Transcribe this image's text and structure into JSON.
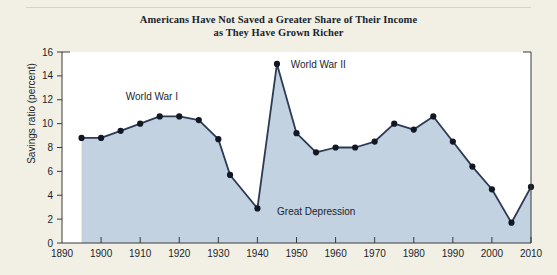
{
  "figure": {
    "background_color": "#f2efe4",
    "title_line1": "Americans Have Not Saved a Greater Share of Their Income",
    "title_line2": "as They Have Grown Richer"
  },
  "chart_data": {
    "type": "area",
    "title": "Americans Have Not Saved a Greater Share of Their Income as They Have Grown Richer",
    "xlabel": "",
    "ylabel": "Savings ratio (percent)",
    "xlim": [
      1890,
      2010
    ],
    "ylim": [
      0,
      16
    ],
    "xticks": [
      1890,
      1900,
      1910,
      1920,
      1930,
      1940,
      1950,
      1960,
      1970,
      1980,
      1990,
      2000,
      2010
    ],
    "yticks": [
      0,
      2,
      4,
      6,
      8,
      10,
      12,
      14,
      16
    ],
    "grid": false,
    "legend": "none",
    "line_color": "#2b3a55",
    "marker_color": "#111823",
    "fill_color": "#c3d2e0",
    "x": [
      1895,
      1900,
      1905,
      1910,
      1915,
      1920,
      1925,
      1930,
      1933,
      1940,
      1945,
      1950,
      1955,
      1960,
      1965,
      1970,
      1975,
      1980,
      1985,
      1990,
      1995,
      2000,
      2005,
      2010
    ],
    "y": [
      8.8,
      8.8,
      9.4,
      10.0,
      10.6,
      10.6,
      10.3,
      8.7,
      5.7,
      2.9,
      15.0,
      9.2,
      7.6,
      8.0,
      8.0,
      8.5,
      10.0,
      9.5,
      10.6,
      8.5,
      6.4,
      4.5,
      1.7,
      4.7
    ],
    "annotations": [
      {
        "label": "World War I",
        "x": 1913,
        "y": 12.0
      },
      {
        "label": "World War II",
        "x": 1947,
        "y": 15.0
      },
      {
        "label": "Great Depression",
        "x": 1944,
        "y": 2.7
      }
    ]
  }
}
